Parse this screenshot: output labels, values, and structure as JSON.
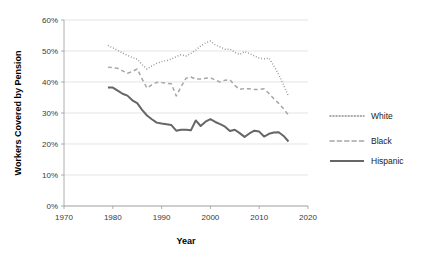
{
  "chart_data": {
    "type": "line",
    "title": "",
    "xlabel": "Year",
    "ylabel": "Workers Covered by Pension",
    "xlim": [
      1970,
      2020
    ],
    "ylim": [
      0,
      60
    ],
    "grid": true,
    "grid_axis": "y",
    "legend_position": "right",
    "x_tick_labels": [
      "1970",
      "1980",
      "1990",
      "2000",
      "2010",
      "2020"
    ],
    "x_ticks": [
      1970,
      1980,
      1990,
      2000,
      2010,
      2020
    ],
    "y_tick_labels": [
      "0%",
      "10%",
      "20%",
      "30%",
      "40%",
      "50%",
      "60%"
    ],
    "y_ticks": [
      0,
      10,
      20,
      30,
      40,
      50,
      60
    ],
    "y_unit": "%",
    "x": [
      1979,
      1980,
      1981,
      1982,
      1983,
      1984,
      1985,
      1986,
      1987,
      1988,
      1989,
      1990,
      1991,
      1992,
      1993,
      1994,
      1995,
      1996,
      1997,
      1998,
      1999,
      2000,
      2001,
      2002,
      2003,
      2004,
      2005,
      2006,
      2007,
      2008,
      2009,
      2010,
      2011,
      2012,
      2013,
      2014,
      2015,
      2016
    ],
    "series": [
      {
        "name": "White",
        "style": "dotted",
        "color": "#8c8c8c",
        "values": [
          51.8,
          51.0,
          50.2,
          49.4,
          48.6,
          47.9,
          47.4,
          45.6,
          44.2,
          45.2,
          46.0,
          46.6,
          46.9,
          47.4,
          48.2,
          48.8,
          48.4,
          49.2,
          50.3,
          51.6,
          52.6,
          53.2,
          52.0,
          51.3,
          50.6,
          50.6,
          49.6,
          48.9,
          49.8,
          49.2,
          48.4,
          47.7,
          47.5,
          47.7,
          45.2,
          42.4,
          39.0,
          35.4
        ]
      },
      {
        "name": "Black",
        "style": "dashed",
        "color": "#a6a6a6",
        "values": [
          44.8,
          44.6,
          44.4,
          43.6,
          42.8,
          43.4,
          44.2,
          41.0,
          38.0,
          39.1,
          39.9,
          39.8,
          39.6,
          39.4,
          35.5,
          38.5,
          41.2,
          41.6,
          40.9,
          41.0,
          41.2,
          41.4,
          40.6,
          40.0,
          40.6,
          40.7,
          38.9,
          37.6,
          37.9,
          37.8,
          37.6,
          37.6,
          37.8,
          36.3,
          34.6,
          33.1,
          31.4,
          29.3
        ]
      },
      {
        "name": "Hispanic",
        "style": "solid",
        "color": "#666666",
        "values": [
          38.2,
          38.2,
          37.2,
          36.2,
          35.6,
          34.1,
          33.2,
          31.0,
          29.2,
          28.0,
          26.9,
          26.6,
          26.4,
          26.1,
          24.3,
          24.6,
          24.6,
          24.4,
          27.6,
          25.8,
          27.2,
          28.0,
          27.1,
          26.4,
          25.6,
          24.2,
          24.6,
          23.5,
          22.3,
          23.4,
          24.3,
          24.0,
          22.4,
          23.3,
          23.7,
          23.8,
          22.6,
          20.8
        ]
      }
    ]
  },
  "legend": {
    "entries": [
      {
        "label": "White"
      },
      {
        "label": "Black"
      },
      {
        "label": "Hispanic"
      }
    ]
  },
  "axes": {
    "x_title": "Year",
    "y_title": "Workers Covered by Pension"
  }
}
